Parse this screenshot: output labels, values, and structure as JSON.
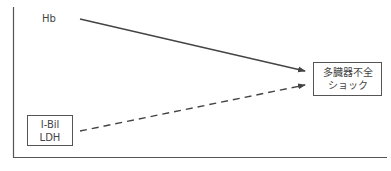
{
  "diagram": {
    "nodes": {
      "hb": {
        "label": "Hb"
      },
      "ibil_ldh": {
        "lines": [
          "I-Bil",
          "LDH"
        ]
      },
      "outcome": {
        "lines": [
          "多臓器不全",
          "ショック"
        ]
      }
    },
    "edges": [
      {
        "from": "hb",
        "to": "outcome",
        "style": "solid"
      },
      {
        "from": "ibil_ldh",
        "to": "outcome",
        "style": "dashed"
      }
    ],
    "colors": {
      "line": "#444444",
      "text": "#444444",
      "background": "#ffffff"
    }
  }
}
